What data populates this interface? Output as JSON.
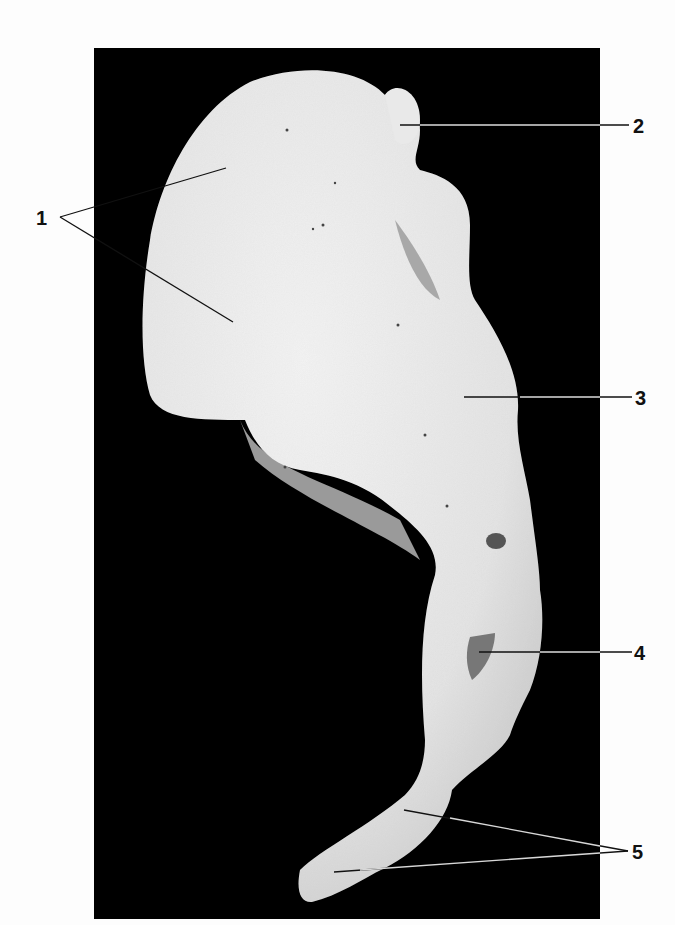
{
  "figure": {
    "background_color": "#000000",
    "bone_color": "#ececec"
  },
  "labels": [
    {
      "id": "1",
      "text": "1"
    },
    {
      "id": "2",
      "text": "2"
    },
    {
      "id": "3",
      "text": "3"
    },
    {
      "id": "4",
      "text": "4"
    },
    {
      "id": "5",
      "text": "5"
    }
  ]
}
